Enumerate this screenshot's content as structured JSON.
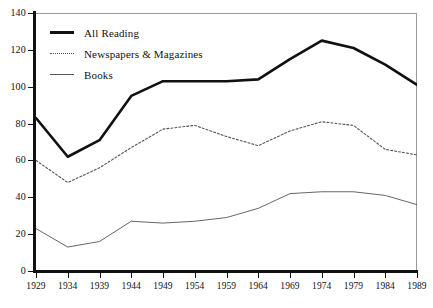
{
  "chart_data": {
    "type": "line",
    "title": "",
    "subtitle": "",
    "xlabel": "",
    "ylabel": "",
    "grid": false,
    "legend_position": "top-left",
    "x": [
      1929,
      1934,
      1939,
      1944,
      1949,
      1954,
      1959,
      1964,
      1969,
      1974,
      1979,
      1984,
      1989
    ],
    "xtick_labels": [
      "1929",
      "1934",
      "1939",
      "1944",
      "1949",
      "1954",
      "1959",
      "1964",
      "1969",
      "1974",
      "1979",
      "1984",
      "1989"
    ],
    "ytick_labels": [
      "0",
      "20",
      "40",
      "60",
      "80",
      "100",
      "120",
      "140"
    ],
    "yticks": [
      0,
      20,
      40,
      60,
      80,
      100,
      120,
      140
    ],
    "xlim": [
      1929,
      1989
    ],
    "ylim": [
      0,
      140
    ],
    "series": [
      {
        "name": "All Reading",
        "style": "solid-thick",
        "color": "#111111",
        "values": [
          83,
          62,
          71,
          95,
          103,
          103,
          103,
          104,
          115,
          125,
          121,
          112,
          101
        ]
      },
      {
        "name": "Newspapers & Magazines",
        "style": "dotted",
        "color": "#555555",
        "values": [
          60,
          48,
          56,
          67,
          77,
          79,
          73,
          68,
          76,
          81,
          79,
          66,
          63
        ]
      },
      {
        "name": "Books",
        "style": "solid-thin",
        "color": "#555555",
        "values": [
          23,
          13,
          16,
          27,
          26,
          27,
          29,
          34,
          42,
          43,
          43,
          41,
          36
        ]
      }
    ]
  },
  "legend": {
    "entries": [
      {
        "label": "All Reading"
      },
      {
        "label": "Newspapers & Magazines"
      },
      {
        "label": "Books"
      }
    ]
  }
}
